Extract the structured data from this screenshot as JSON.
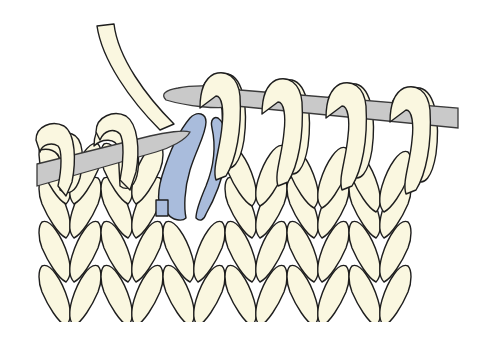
{
  "figure": {
    "colors": {
      "yarn": "#FAF7E0",
      "highlight_stitch": "#A9BCDC",
      "needle": "#C9C9C9",
      "outline": "#1E1E1E",
      "background": "#FFFFFF"
    },
    "elements": {
      "right_needle_loops": 4,
      "left_needle_loops": 2,
      "fabric_columns": 7,
      "fabric_rows_visible": 4,
      "highlighted_stitches": 1
    }
  }
}
